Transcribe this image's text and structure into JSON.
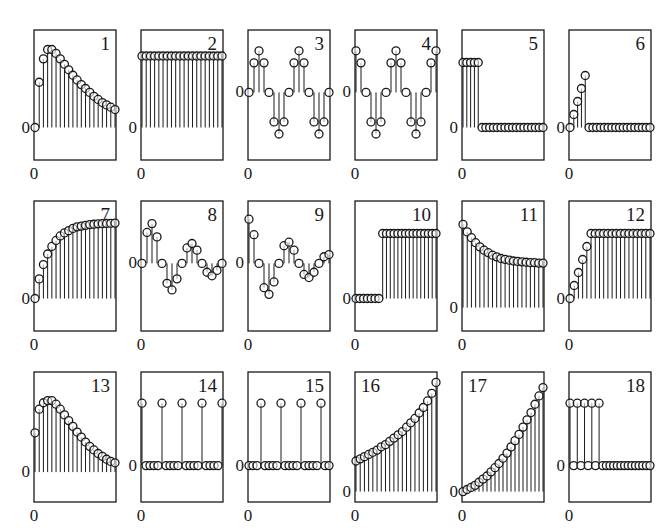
{
  "layout": {
    "col_x": [
      34,
      141,
      248,
      355,
      462,
      569
    ],
    "row_y": [
      30,
      201,
      372
    ],
    "box_w": 82,
    "box_h": 130,
    "ink": "#1a1a1a",
    "stem_stroke": 1,
    "marker_radius": 4
  },
  "chart_data": {
    "type": "stem",
    "title": "",
    "grid": false,
    "panels": [
      {
        "id": "1",
        "label": "1",
        "label_pos": "right",
        "zero_frac": 0.75,
        "scale": 0.6,
        "xlabel": "0",
        "ylabel": "0",
        "values": [
          0,
          0.58,
          0.88,
          1.0,
          1.0,
          0.95,
          0.88,
          0.81,
          0.74,
          0.67,
          0.61,
          0.55,
          0.5,
          0.45,
          0.4,
          0.36,
          0.32,
          0.29,
          0.26,
          0.23
        ]
      },
      {
        "id": "2",
        "label": "2",
        "label_pos": "right",
        "zero_frac": 0.75,
        "scale": 0.55,
        "xlabel": "0",
        "ylabel": "0",
        "values": [
          1,
          1,
          1,
          1,
          1,
          1,
          1,
          1,
          1,
          1,
          1,
          1,
          1,
          1,
          1,
          1,
          1,
          1,
          1,
          1
        ]
      },
      {
        "id": "3",
        "label": "3",
        "label_pos": "right",
        "zero_frac": 0.48,
        "scale": 0.32,
        "xlabel": "0",
        "ylabel": "0",
        "values": [
          0,
          0.71,
          1,
          0.71,
          0,
          -0.71,
          -1,
          -0.71,
          0,
          0.71,
          1,
          0.71,
          0,
          -0.71,
          -1,
          -0.71,
          0
        ]
      },
      {
        "id": "4",
        "label": "4",
        "label_pos": "right",
        "zero_frac": 0.48,
        "scale": 0.32,
        "xlabel": "0",
        "ylabel": "0",
        "values": [
          1,
          0.71,
          0,
          -0.71,
          -1,
          -0.71,
          0,
          0.71,
          1,
          0.71,
          0,
          -0.71,
          -1,
          -0.71,
          0,
          0.71,
          1
        ]
      },
      {
        "id": "5",
        "label": "5",
        "label_pos": "right",
        "zero_frac": 0.75,
        "scale": 0.5,
        "xlabel": "0",
        "ylabel": "0",
        "values": [
          1,
          1,
          1,
          1,
          1,
          0,
          0,
          0,
          0,
          0,
          0,
          0,
          0,
          0,
          0,
          0,
          0,
          0,
          0,
          0,
          0,
          0
        ]
      },
      {
        "id": "6",
        "label": "6",
        "label_pos": "right",
        "zero_frac": 0.75,
        "scale": 0.4,
        "xlabel": "0",
        "ylabel": "0",
        "values": [
          0,
          0.25,
          0.5,
          0.75,
          1,
          0,
          0,
          0,
          0,
          0,
          0,
          0,
          0,
          0,
          0,
          0,
          0,
          0,
          0,
          0,
          0,
          0
        ]
      },
      {
        "id": "7",
        "label": "7",
        "label_pos": "right",
        "zero_frac": 0.75,
        "scale": 0.58,
        "xlabel": "0",
        "ylabel": "0",
        "values": [
          0,
          0.26,
          0.45,
          0.59,
          0.69,
          0.77,
          0.83,
          0.87,
          0.9,
          0.93,
          0.95,
          0.96,
          0.97,
          0.98,
          0.985,
          0.99,
          0.993,
          0.995,
          0.997,
          1.0
        ]
      },
      {
        "id": "8",
        "label": "8",
        "label_pos": "right",
        "zero_frac": 0.48,
        "scale": 0.34,
        "xlabel": "0",
        "ylabel": "0",
        "values": [
          0,
          0.7,
          0.9,
          0.6,
          0,
          -0.45,
          -0.6,
          -0.35,
          0,
          0.35,
          0.45,
          0.3,
          0,
          -0.2,
          -0.28,
          -0.16,
          0
        ]
      },
      {
        "id": "9",
        "label": "9",
        "label_pos": "right",
        "zero_frac": 0.48,
        "scale": 0.34,
        "xlabel": "0",
        "ylabel": "0",
        "values": [
          1.0,
          0.65,
          0,
          -0.55,
          -0.7,
          -0.42,
          0,
          0.4,
          0.48,
          0.3,
          0,
          -0.25,
          -0.32,
          -0.2,
          0,
          0.15,
          0.2
        ]
      },
      {
        "id": "10",
        "label": "10",
        "label_pos": "right",
        "zero_frac": 0.75,
        "scale": 0.5,
        "xlabel": "0",
        "ylabel": "0",
        "values": [
          0,
          0,
          0,
          0,
          0,
          0,
          0,
          1,
          1,
          1,
          1,
          1,
          1,
          1,
          1,
          1,
          1,
          1,
          1,
          1,
          1,
          1
        ]
      },
      {
        "id": "11",
        "label": "11",
        "label_pos": "right",
        "zero_frac": 0.82,
        "scale": 0.64,
        "xlabel": "0",
        "ylabel": "0",
        "values": [
          1.0,
          0.91,
          0.84,
          0.78,
          0.73,
          0.69,
          0.66,
          0.63,
          0.61,
          0.59,
          0.58,
          0.57,
          0.56,
          0.555,
          0.55,
          0.545,
          0.54,
          0.54,
          0.535,
          0.535
        ]
      },
      {
        "id": "12",
        "label": "12",
        "label_pos": "right",
        "zero_frac": 0.75,
        "scale": 0.5,
        "xlabel": "0",
        "ylabel": "0",
        "values": [
          0,
          0.2,
          0.4,
          0.6,
          0.8,
          1,
          1,
          1,
          1,
          1,
          1,
          1,
          1,
          1,
          1,
          1,
          1,
          1,
          1,
          1
        ]
      },
      {
        "id": "13",
        "label": "13",
        "label_pos": "right",
        "zero_frac": 0.77,
        "scale": 0.55,
        "xlabel": "0",
        "ylabel": "0",
        "values": [
          0.55,
          0.88,
          0.97,
          1.0,
          1.0,
          0.95,
          0.88,
          0.8,
          0.72,
          0.64,
          0.56,
          0.49,
          0.42,
          0.36,
          0.31,
          0.26,
          0.22,
          0.18,
          0.15,
          0.13
        ]
      },
      {
        "id": "14",
        "label": "14",
        "label_pos": "right",
        "zero_frac": 0.72,
        "scale": 0.48,
        "xlabel": "0",
        "ylabel": "0",
        "values": [
          1,
          0,
          0,
          0,
          0,
          1,
          0,
          0,
          0,
          0,
          1,
          0,
          0,
          0,
          0,
          1,
          0,
          0,
          0,
          0,
          1
        ]
      },
      {
        "id": "15",
        "label": "15",
        "label_pos": "right",
        "zero_frac": 0.72,
        "scale": 0.48,
        "xlabel": "0",
        "ylabel": "0",
        "values": [
          0,
          0,
          0,
          1,
          0,
          0,
          0,
          0,
          1,
          0,
          0,
          0,
          0,
          1,
          0,
          0,
          0,
          0,
          1,
          0,
          0
        ]
      },
      {
        "id": "16",
        "label": "16",
        "label_pos": "left",
        "zero_frac": 0.92,
        "scale": 0.84,
        "xlabel": "0",
        "ylabel": "0",
        "values": [
          0.28,
          0.3,
          0.32,
          0.34,
          0.36,
          0.38,
          0.41,
          0.43,
          0.46,
          0.49,
          0.52,
          0.55,
          0.59,
          0.63,
          0.67,
          0.72,
          0.77,
          0.83,
          0.9,
          1.0
        ]
      },
      {
        "id": "17",
        "label": "17",
        "label_pos": "left",
        "zero_frac": 0.92,
        "scale": 0.8,
        "xlabel": "0",
        "ylabel": "0",
        "values": [
          0,
          0.02,
          0.04,
          0.06,
          0.09,
          0.12,
          0.15,
          0.19,
          0.23,
          0.27,
          0.32,
          0.37,
          0.43,
          0.49,
          0.55,
          0.62,
          0.69,
          0.76,
          0.84,
          0.92,
          1.0
        ]
      },
      {
        "id": "18",
        "label": "18",
        "label_pos": "right",
        "zero_frac": 0.72,
        "scale": 0.48,
        "xlabel": "0",
        "ylabel": "0",
        "values": [
          1,
          0,
          1,
          0,
          1,
          0,
          1,
          0,
          1,
          0,
          0,
          0,
          0,
          0,
          0,
          0,
          0,
          0,
          0,
          0,
          0,
          0,
          0
        ],
        "stem_pairs": true
      }
    ]
  }
}
